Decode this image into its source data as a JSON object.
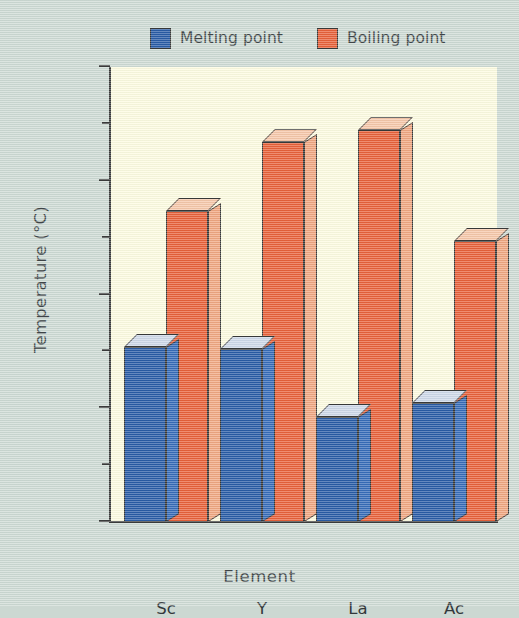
{
  "chart_data": {
    "type": "bar",
    "title": "",
    "xlabel": "Element",
    "ylabel": "Temperature (°C)",
    "categories": [
      "Sc",
      "Y",
      "La",
      "Ac"
    ],
    "series": [
      {
        "name": "Melting point",
        "color": "#1b50a0",
        "values": [
          1540,
          1520,
          920,
          1050
        ]
      },
      {
        "name": "Boiling point",
        "color": "#e8562c",
        "values": [
          2730,
          3340,
          3450,
          2470
        ]
      }
    ],
    "ylim": [
      0,
      4000
    ],
    "ytick_labels": [
      "0",
      "1000",
      "2000",
      "3000",
      "4000"
    ],
    "ytick_values": [
      0,
      1000,
      2000,
      3000,
      4000
    ],
    "yminor_values": [
      500,
      1500,
      2500,
      3500
    ],
    "grid": false,
    "legend_position": "top-center",
    "style": "3d-bars"
  },
  "colors": {
    "page_background": "#ccd8d2",
    "plot_background": "#fdfbdf",
    "melting_front": "#1b50a0",
    "melting_side": "#2a62b4",
    "melting_top": "#ccd6e8",
    "boiling_front": "#e8562c",
    "boiling_side": "#f0a078",
    "boiling_top": "#f6c3a4",
    "axis": "#2e2e2e",
    "text": "#33383b"
  }
}
